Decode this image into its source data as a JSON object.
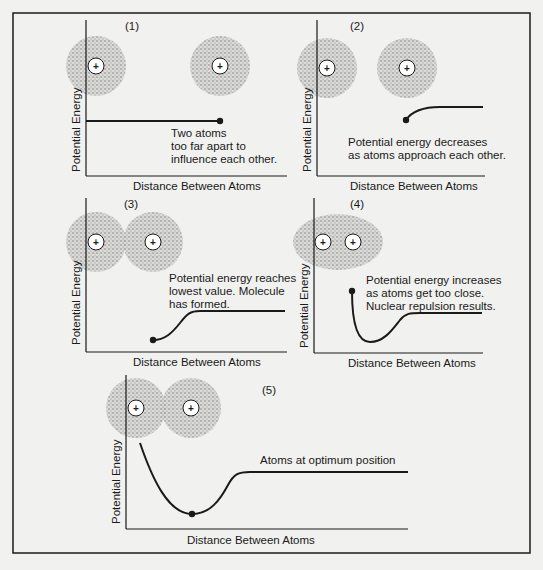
{
  "figure": {
    "border_color": "#1a1a1a",
    "background": "#f1f1ef",
    "line_color": "#1a1a1a",
    "cloud_color": "#7a7a7a"
  },
  "axes": {
    "y_label": "Potential Energy",
    "x_label": "Distance Between Atoms"
  },
  "nucleus_symbol": "+",
  "panels": [
    {
      "number": "(1)",
      "caption": [
        "Two atoms",
        "too far apart to",
        "influence each other."
      ]
    },
    {
      "number": "(2)",
      "caption": [
        "Potential energy decreases",
        "as atoms approach each other."
      ]
    },
    {
      "number": "(3)",
      "caption": [
        "Potential energy reaches",
        "lowest value. Molecule",
        "has formed."
      ]
    },
    {
      "number": "(4)",
      "caption": [
        "Potential energy increases",
        "as atoms get too close.",
        "Nuclear repulsion results."
      ]
    },
    {
      "number": "(5)",
      "caption": [
        "Atoms at optimum position"
      ]
    }
  ]
}
